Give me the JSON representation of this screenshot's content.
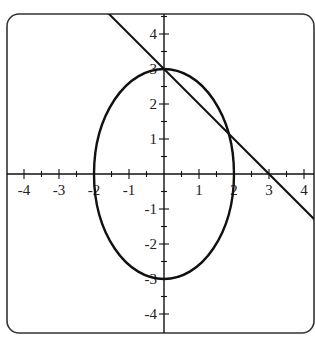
{
  "chart_data": {
    "type": "line",
    "title": "",
    "xlabel": "",
    "ylabel": "",
    "xlim": [
      -4.6,
      4.3
    ],
    "ylim": [
      -4.5,
      4.6
    ],
    "grid": false,
    "legend": null,
    "x_ticks": [
      -4,
      -3,
      -2,
      -1,
      1,
      2,
      3,
      4
    ],
    "y_ticks": [
      4,
      3,
      2,
      1,
      -1,
      -2,
      -3,
      -4
    ],
    "x_tick_labels": [
      "-4",
      "-3",
      "-2",
      "-1",
      "1",
      "2",
      "3",
      "4"
    ],
    "y_tick_labels": [
      "4",
      "3",
      "2",
      "1",
      "-1",
      "-2",
      "-3",
      "-4"
    ],
    "minor_tick_step": 0.5,
    "series": [
      {
        "name": "ellipse",
        "kind": "ellipse",
        "equation": "x^2/4 + y^2/9 = 1",
        "center": [
          0,
          0
        ],
        "semi_axis_x": 2,
        "semi_axis_y": 3
      },
      {
        "name": "line",
        "kind": "line",
        "equation": "y = -x + 3",
        "slope": -1,
        "intercept": 3,
        "x_intercept": 3
      }
    ],
    "intersections": [
      [
        0,
        3
      ],
      [
        1.846,
        1.154
      ]
    ]
  },
  "style": {
    "stroke": "#111111",
    "frame": "#333333"
  }
}
